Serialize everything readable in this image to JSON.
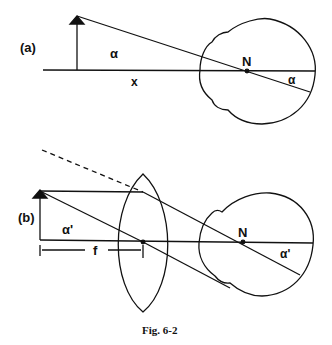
{
  "panel_a": {
    "label": "(a)",
    "angle_label_left": "α",
    "angle_label_right": "α",
    "distance_label": "x",
    "nodal_point_label": "N"
  },
  "panel_b": {
    "label": "(b)",
    "angle_label_left": "α'",
    "angle_label_right": "α'",
    "focal_length_label": "f",
    "nodal_point_label": "N"
  },
  "caption": "Fig. 6-2"
}
